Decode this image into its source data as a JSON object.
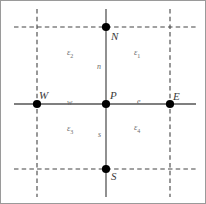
{
  "figure": {
    "type": "finite-volume-stencil-diagram",
    "width": 206,
    "height": 204,
    "background_color": "#ffffff",
    "border_color": "#9a9a9a"
  },
  "style": {
    "solid_line_color": "#555555",
    "dashed_line_color": "#444444",
    "node_color": "#000000",
    "label_color": "#4a4a4a"
  },
  "nodes": [
    {
      "id": "P",
      "label": "P",
      "x": 105,
      "y": 103
    },
    {
      "id": "W",
      "label": "W",
      "x": 36,
      "y": 103
    },
    {
      "id": "E",
      "label": "E",
      "x": 169,
      "y": 103
    },
    {
      "id": "N",
      "label": "N",
      "x": 105,
      "y": 26
    },
    {
      "id": "S",
      "label": "S",
      "x": 105,
      "y": 168
    }
  ],
  "face_labels": [
    {
      "id": "w",
      "label": "w",
      "x": 68,
      "y": 101
    },
    {
      "id": "e",
      "label": "e",
      "x": 137,
      "y": 100
    },
    {
      "id": "n",
      "label": "n",
      "x": 98,
      "y": 66
    },
    {
      "id": "s",
      "label": "s",
      "x": 98,
      "y": 134
    }
  ],
  "region_labels": [
    {
      "id": "eps1",
      "symbol": "ε",
      "subscript": "1",
      "quadrant": "upper-right",
      "x": 136,
      "y": 51
    },
    {
      "id": "eps2",
      "symbol": "ε",
      "symbol_alt": "ε",
      "subscript": "2",
      "quadrant": "upper-left",
      "x": 70,
      "y": 51
    },
    {
      "id": "eps3",
      "symbol": "ε",
      "subscript": "3",
      "quadrant": "lower-left",
      "x": 70,
      "y": 127
    },
    {
      "id": "eps4",
      "symbol": "ε",
      "subscript": "4",
      "quadrant": "lower-right",
      "x": 136,
      "y": 126
    }
  ],
  "solid_lines": [
    {
      "id": "horizontal-axis",
      "x1": 13,
      "y1": 103,
      "x2": 195,
      "y2": 103
    },
    {
      "id": "vertical-axis",
      "x1": 105,
      "y1": 8,
      "x2": 105,
      "y2": 196
    }
  ],
  "dashed_lines": [
    {
      "id": "west-face-line",
      "orientation": "vertical",
      "x1": 36,
      "y1": 8,
      "x2": 36,
      "y2": 196
    },
    {
      "id": "east-face-line",
      "orientation": "vertical",
      "x1": 169,
      "y1": 8,
      "x2": 169,
      "y2": 196
    },
    {
      "id": "north-face-line",
      "orientation": "horizontal",
      "x1": 13,
      "y1": 26,
      "x2": 195,
      "y2": 26
    },
    {
      "id": "south-face-line",
      "orientation": "horizontal",
      "x1": 13,
      "y1": 168,
      "x2": 195,
      "y2": 168
    }
  ]
}
